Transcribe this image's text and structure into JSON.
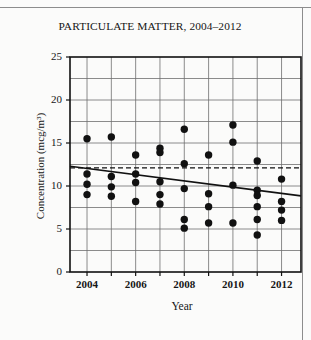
{
  "chart_data": {
    "type": "scatter",
    "title": "PARTICULATE MATTER, 2004–2012",
    "xlabel": "Year",
    "ylabel": "Concentration (mcg/m³)",
    "xlim": [
      2003.3,
      2012.8
    ],
    "ylim": [
      0,
      25
    ],
    "yticks": [
      0,
      5,
      10,
      15,
      20,
      25
    ],
    "xticks": [
      2004,
      2005,
      2006,
      2007,
      2008,
      2009,
      2010,
      2011,
      2012
    ],
    "xtick_labels_shown": [
      "2004",
      "2006",
      "2008",
      "2010",
      "2012"
    ],
    "grid": true,
    "legend": "none",
    "marker": {
      "shape": "circle",
      "color": "#111111",
      "size": 4.6
    },
    "points": [
      {
        "x": 2004,
        "y": 15.5
      },
      {
        "x": 2004,
        "y": 11.4
      },
      {
        "x": 2004,
        "y": 10.2
      },
      {
        "x": 2004,
        "y": 9.0
      },
      {
        "x": 2005,
        "y": 15.7
      },
      {
        "x": 2005,
        "y": 11.1
      },
      {
        "x": 2005,
        "y": 9.9
      },
      {
        "x": 2005,
        "y": 8.8
      },
      {
        "x": 2006,
        "y": 13.6
      },
      {
        "x": 2006,
        "y": 11.4
      },
      {
        "x": 2006,
        "y": 10.4
      },
      {
        "x": 2006,
        "y": 8.2
      },
      {
        "x": 2007,
        "y": 14.4
      },
      {
        "x": 2007,
        "y": 13.9
      },
      {
        "x": 2007,
        "y": 10.5
      },
      {
        "x": 2007,
        "y": 9.0
      },
      {
        "x": 2007,
        "y": 7.9
      },
      {
        "x": 2008,
        "y": 16.6
      },
      {
        "x": 2008,
        "y": 12.6
      },
      {
        "x": 2008,
        "y": 9.7
      },
      {
        "x": 2008,
        "y": 6.1
      },
      {
        "x": 2008,
        "y": 5.1
      },
      {
        "x": 2009,
        "y": 13.6
      },
      {
        "x": 2009,
        "y": 9.1
      },
      {
        "x": 2009,
        "y": 7.6
      },
      {
        "x": 2009,
        "y": 5.7
      },
      {
        "x": 2010,
        "y": 17.1
      },
      {
        "x": 2010,
        "y": 15.1
      },
      {
        "x": 2010,
        "y": 10.1
      },
      {
        "x": 2010,
        "y": 5.7
      },
      {
        "x": 2011,
        "y": 12.9
      },
      {
        "x": 2011,
        "y": 9.5
      },
      {
        "x": 2011,
        "y": 8.9
      },
      {
        "x": 2011,
        "y": 7.6
      },
      {
        "x": 2011,
        "y": 6.1
      },
      {
        "x": 2011,
        "y": 4.3
      },
      {
        "x": 2012,
        "y": 10.8
      },
      {
        "x": 2012,
        "y": 8.2
      },
      {
        "x": 2012,
        "y": 7.2
      },
      {
        "x": 2012,
        "y": 6.0
      }
    ],
    "trend_line": {
      "style": "solid",
      "color": "#111111",
      "x_start": 2003.3,
      "y_start": 12.3,
      "x_end": 2012.8,
      "y_end": 8.85
    },
    "reference_line": {
      "style": "dashed",
      "color": "#111111",
      "y": 12.1,
      "label": ""
    }
  }
}
